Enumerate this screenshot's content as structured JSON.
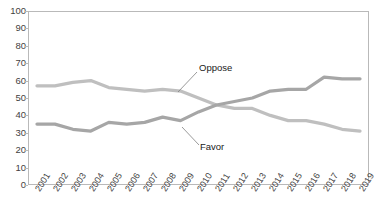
{
  "chart_data": {
    "type": "line",
    "title": "",
    "xlabel": "",
    "ylabel": "",
    "ylim": [
      0,
      100
    ],
    "ytick_step": 10,
    "grid": false,
    "legend_position": "inline-annotations",
    "categories": [
      "2001",
      "2002",
      "2003",
      "2004",
      "2005",
      "2006",
      "2007",
      "2008",
      "2009",
      "2010",
      "2011",
      "2012",
      "2013",
      "2014",
      "2015",
      "2016",
      "2017",
      "2018",
      "2019"
    ],
    "yticks": [
      "0",
      "10",
      "20",
      "30",
      "40",
      "50",
      "60",
      "70",
      "80",
      "90",
      "100"
    ],
    "series": [
      {
        "name": "Oppose",
        "color": "#bfbfbf",
        "values": [
          57,
          57,
          59,
          60,
          56,
          55,
          54,
          55,
          54,
          50,
          46,
          44,
          44,
          40,
          37,
          37,
          35,
          32,
          31
        ]
      },
      {
        "name": "Favor",
        "color": "#a6a6a6",
        "values": [
          35,
          35,
          32,
          31,
          36,
          35,
          36,
          39,
          37,
          42,
          46,
          48,
          50,
          54,
          55,
          55,
          62,
          61,
          61
        ]
      }
    ],
    "annotations": [
      {
        "name": "Oppose",
        "label": "Oppose"
      },
      {
        "name": "Favor",
        "label": "Favor"
      }
    ]
  }
}
